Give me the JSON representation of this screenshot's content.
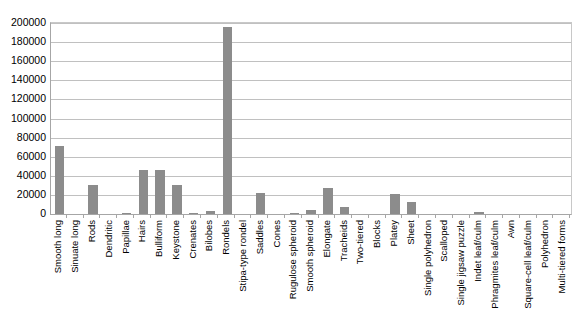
{
  "chart_data": {
    "type": "bar",
    "title": "",
    "subtitle": "",
    "xlabel": "",
    "ylabel": "",
    "ylim": [
      0,
      200000
    ],
    "ytick_step": 20000,
    "ytick_labels": [
      "200000",
      "180000",
      "160000",
      "140000",
      "120000",
      "100000",
      "80000",
      "60000",
      "40000",
      "20000",
      "0"
    ],
    "grid": true,
    "legend": "none",
    "bar_color": "#8c8c8c",
    "axis_color": "#a6a6a6",
    "gridline_color": "#c0c0c0",
    "categories": [
      "Smooth long",
      "Sinuate long",
      "Rods",
      "Dendritic",
      "Papillae",
      "Hairs",
      "Bulliform",
      "Keystone",
      "Crenates",
      "Bilobes",
      "Rondels",
      "Stipa-type rondel",
      "Saddles",
      "Cones",
      "Rugulose spheroid",
      "Smooth spheroid",
      "Elongate",
      "Tracheids",
      "Two-tiered",
      "Blocks",
      "Platey",
      "Sheet",
      "Single polyhedron",
      "Scalloped",
      "Single jigsaw puzzle",
      "Indet leaf/culm",
      "Phragmites leaf/culm",
      "Awn",
      "Square-cell leaf/culm",
      "Polyhedron",
      "Multi-tiered forms"
    ],
    "values": [
      71000,
      0,
      30000,
      0,
      1000,
      46000,
      46000,
      30000,
      1500,
      3000,
      196000,
      0,
      22000,
      0,
      1000,
      4000,
      27000,
      7000,
      0,
      0,
      21000,
      13000,
      0,
      0,
      0,
      2000,
      0,
      0,
      0,
      0,
      0
    ]
  }
}
